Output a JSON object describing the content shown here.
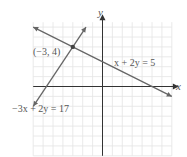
{
  "chart_data": {
    "type": "line",
    "title": "",
    "xlabel": "x",
    "ylabel": "y",
    "xlim": [
      -7,
      7
    ],
    "ylim": [
      -7,
      6.5
    ],
    "grid": true,
    "series": [
      {
        "name": "x + 2y = 5",
        "equation": "x + 2y = 5",
        "x": [
          -7,
          7
        ],
        "y": [
          6,
          -1
        ]
      },
      {
        "name": "-3x + 2y = 17",
        "equation": "-3x + 2y = 17",
        "x": [
          -7,
          -1.667
        ],
        "y": [
          -2,
          6
        ]
      }
    ],
    "annotations": [
      {
        "text": "(−3, 4)",
        "point": [
          -3,
          4
        ]
      },
      {
        "text": "x + 2y = 5"
      },
      {
        "text": "−3x + 2y = 17"
      }
    ]
  },
  "labels": {
    "axis_x": "x",
    "axis_y": "y",
    "point": "(−3, 4)",
    "line1": "x + 2y = 5",
    "line2": "−3x + 2y = 17"
  },
  "colors": {
    "grid": "#e4e4e4",
    "axis": "#333333",
    "line": "#666666",
    "text": "#555555"
  }
}
